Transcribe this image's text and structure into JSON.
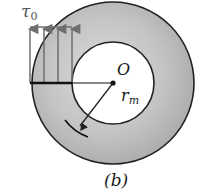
{
  "figure": {
    "caption": "(b)",
    "stress_label_symbol": "τ",
    "stress_label_subscript": "0",
    "center_label": "O",
    "radius_label_symbol": "r",
    "radius_label_subscript": "m",
    "colors": {
      "ring_fill": "#b8b8b8",
      "ring_fill_light": "#d6d6d6",
      "outline": "#222222",
      "arrow": "#6e6e6e",
      "inner_fill": "#ffffff"
    },
    "geometry": {
      "center": [
        113,
        83
      ],
      "outer_radius": 81,
      "inner_radius": 41,
      "arrow_x": [
        30,
        44,
        58,
        72
      ],
      "arrow_top_y": 27,
      "arrow_base_y": 83
    }
  }
}
